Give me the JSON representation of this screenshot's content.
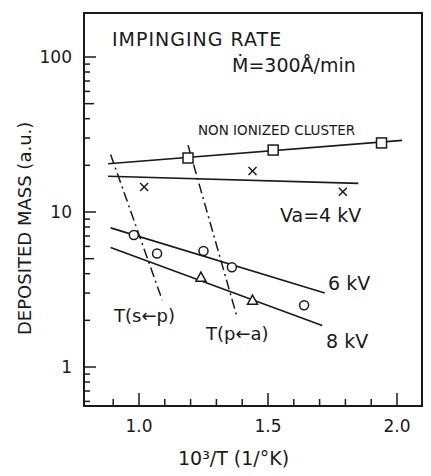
{
  "chart_data": {
    "type": "scatter",
    "title": "IMPINGING RATE",
    "subtitle": "Ṁ=300Å/min",
    "xlabel": "10³/T (1/°K)",
    "ylabel": "DEPOSITED MASS (a.u.)",
    "xlim": [
      0.78,
      2.09
    ],
    "ylim": [
      0.56,
      190
    ],
    "yscale": "log",
    "grid": false,
    "xticks": [
      1.0,
      1.5,
      2.0
    ],
    "xtick_labels": [
      "1.0",
      "1.5",
      "2.0"
    ],
    "yticks": [
      1,
      10,
      100
    ],
    "ytick_labels": [
      "1",
      "10",
      "100"
    ],
    "series": [
      {
        "name": "NON IONIZED CLUSTER",
        "marker": "square",
        "points": [
          [
            1.19,
            22.3
          ],
          [
            1.52,
            25.1
          ],
          [
            1.94,
            27.9
          ]
        ],
        "fit_line": [
          [
            0.88,
            20.5
          ],
          [
            2.02,
            29.0
          ]
        ]
      },
      {
        "name": "Va=4 kV",
        "marker": "x",
        "points": [
          [
            1.02,
            14.5
          ],
          [
            1.44,
            18.4
          ],
          [
            1.79,
            13.5
          ]
        ],
        "fit_line": [
          [
            0.88,
            17.0
          ],
          [
            1.85,
            15.3
          ]
        ]
      },
      {
        "name": "6 kV",
        "marker": "circle",
        "points": [
          [
            0.98,
            7.1
          ],
          [
            1.07,
            5.4
          ],
          [
            1.25,
            5.6
          ],
          [
            1.36,
            4.4
          ],
          [
            1.64,
            2.5
          ]
        ],
        "fit_line": [
          [
            0.89,
            7.9
          ],
          [
            1.72,
            3.0
          ]
        ]
      },
      {
        "name": "8 kV",
        "marker": "triangle",
        "points": [
          [
            1.24,
            3.8
          ],
          [
            1.44,
            2.7
          ]
        ],
        "fit_line": [
          [
            0.89,
            5.9
          ],
          [
            1.71,
            1.85
          ]
        ]
      }
    ],
    "reference_lines": [
      {
        "name": "T(s←p)",
        "style": "dash-dot",
        "from": [
          0.89,
          23.5
        ],
        "to": [
          1.09,
          2.7
        ]
      },
      {
        "name": "T(p←a)",
        "style": "dash-dot",
        "from": [
          1.19,
          27.0
        ],
        "to": [
          1.38,
          2.1
        ]
      }
    ],
    "annotations": [
      {
        "text": "NON IONIZED CLUSTER",
        "x": 1.52,
        "y": 33
      },
      {
        "text": "Va = 4 kV",
        "x": 1.67,
        "y": 10.5
      },
      {
        "text": "6 kV",
        "x": 1.88,
        "y": 3.2
      },
      {
        "text": "8 kV",
        "x": 1.88,
        "y": 1.95
      },
      {
        "text": "T(s←p)",
        "x": 0.96,
        "y": 1.95
      },
      {
        "text": "T(p←a)",
        "x": 1.28,
        "y": 1.7
      }
    ]
  },
  "labels": {
    "title": "IMPINGING RATE",
    "rate": "Ṁ=300Å/min",
    "xlabel": "10³/T (1/°K)",
    "ylabel": "DEPOSITED MASS (a.u.)",
    "nonionized": "NON IONIZED CLUSTER",
    "va4": "Va=4 kV",
    "kv6": "6 kV",
    "kv8": "8 kV",
    "tsp": "T(s←p)",
    "tpa": "T(p←a)"
  }
}
